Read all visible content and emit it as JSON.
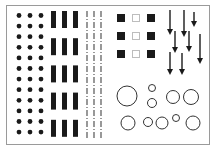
{
  "figure": {
    "colors": {
      "ink": "#1a1a1a",
      "frame": "#9a9a9a",
      "background": "#ffffff",
      "hollow_square": "#bdbdbd"
    },
    "panels": [
      {
        "name": "dot-grid",
        "kind": "dots",
        "columns": 3,
        "rows": 12
      },
      {
        "name": "bar-groups",
        "kind": "filled-bars",
        "groups": 5,
        "bars_per_group": 3
      },
      {
        "name": "dashed-lines",
        "kind": "dashed-vertical-lines",
        "count": 3
      },
      {
        "name": "square-grid",
        "kind": "squares",
        "rows": 3,
        "pattern": [
          "filled",
          "hollow",
          "filled"
        ]
      },
      {
        "name": "arrow-field",
        "kind": "down-arrows",
        "count": 9
      },
      {
        "name": "circle-field",
        "kind": "hollow-circles",
        "count": 11
      }
    ]
  }
}
